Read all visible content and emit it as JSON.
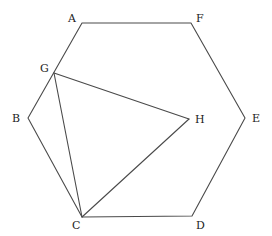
{
  "diagram": {
    "type": "geometry",
    "stroke_color": "#4a4a4a",
    "label_color": "#222222",
    "points": {
      "A": {
        "label": "A",
        "x": 82,
        "y": 23,
        "label_x": 68,
        "label_y": 22
      },
      "F": {
        "label": "F",
        "x": 191,
        "y": 23,
        "label_x": 196,
        "label_y": 22
      },
      "E": {
        "label": "E",
        "x": 245,
        "y": 118,
        "label_x": 252,
        "label_y": 122
      },
      "D": {
        "label": "D",
        "x": 192,
        "y": 216,
        "label_x": 196,
        "label_y": 229
      },
      "C": {
        "label": "C",
        "x": 82,
        "y": 217,
        "label_x": 72,
        "label_y": 229
      },
      "B": {
        "label": "B",
        "x": 28,
        "y": 118,
        "label_x": 12,
        "label_y": 122
      },
      "G": {
        "label": "G",
        "x": 54,
        "y": 73,
        "label_x": 40,
        "label_y": 72
      },
      "H": {
        "label": "H",
        "x": 189,
        "y": 119,
        "label_x": 195,
        "label_y": 123
      }
    },
    "polygons": [
      {
        "name": "hexagon-ABCDEF",
        "vertices": [
          "A",
          "F",
          "E",
          "D",
          "C",
          "B"
        ]
      }
    ],
    "segments": [
      {
        "name": "segment-GH",
        "from": "G",
        "to": "H"
      },
      {
        "name": "segment-GC",
        "from": "G",
        "to": "C"
      },
      {
        "name": "segment-HC",
        "from": "H",
        "to": "C"
      }
    ]
  }
}
